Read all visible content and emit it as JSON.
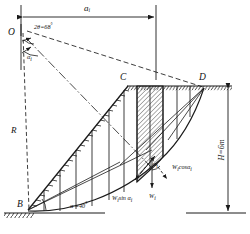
{
  "figure": {
    "type": "engineering-diagram",
    "ink_color": "#1a1a1a",
    "hatch_color": "#333333",
    "background": "#ffffff"
  },
  "labels": {
    "center_point": "O",
    "slope_toe": "B",
    "crest_left": "C",
    "crest_right": "D",
    "radius": "R",
    "top_dimension": "a",
    "top_dimension_sub": "i",
    "central_angle": "2θ=68",
    "central_angle_unit": "°",
    "alpha_i_left": "α",
    "alpha_i_left_sub": "i",
    "alpha_i_slice": "α",
    "alpha_i_slice_sub": "i",
    "slope_angle": "α =40",
    "slope_angle_unit": "°",
    "height_dimension": "H=6m",
    "force_weight": "W",
    "force_weight_sub": "i",
    "force_normal": "cosα",
    "force_normal_prefix": "W",
    "force_normal_sub1": "i",
    "force_normal_sub2": "i",
    "force_tangential_prefix": "W",
    "force_tangential": "sin α",
    "force_tangential_sub1": "i",
    "force_tangential_sub2": "i"
  },
  "geometry": {
    "O": [
      22,
      30
    ],
    "B": [
      28,
      210
    ],
    "C": [
      128,
      86
    ],
    "D": [
      205,
      86
    ],
    "ground_y": 213,
    "crest_y": 86,
    "top_dim_y": 12,
    "top_dim_x1": 20,
    "top_dim_x2": 156,
    "right_dim_x": 228,
    "slice_count": 8,
    "hatched_slice_index": 5
  },
  "values": {
    "theta_2": 68,
    "alpha": 40,
    "H": 6,
    "H_unit": "m"
  }
}
